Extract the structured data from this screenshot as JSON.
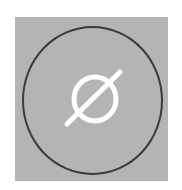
{
  "icon": {
    "name": "empty-set-icon",
    "glyph": "ø",
    "colors": {
      "background": "#b4b4b4",
      "ring": "#3a3a3a",
      "glyph": "#ffffff",
      "page": "#ffffff"
    }
  }
}
